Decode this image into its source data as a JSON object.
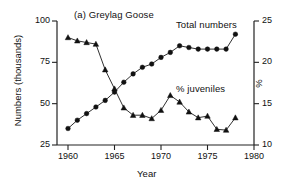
{
  "panel": {
    "title": "(a) Greylag Goose"
  },
  "axes": {
    "x_title": "Year",
    "y_left_title": "Numbers (thousands)",
    "y_right_title": "%",
    "x_ticks": [
      "1960",
      "1965",
      "1970",
      "1975",
      "1980"
    ],
    "y_left_ticks": [
      "100",
      "75",
      "50",
      "25"
    ],
    "y_right_ticks": [
      "25",
      "20",
      "15",
      "10"
    ]
  },
  "annotations": {
    "total_label": "Total numbers",
    "juveniles_label": "% juveniles"
  },
  "chart_data": {
    "type": "line",
    "title": "(a) Greylag Goose",
    "xlabel": "Year",
    "ylabel": "Numbers (thousands)",
    "ylabel_right": "%",
    "xlim": [
      1959,
      1980
    ],
    "ylim": [
      25,
      100
    ],
    "ylim_right": [
      10,
      25
    ],
    "xticks": [
      1960,
      1965,
      1970,
      1975,
      1980
    ],
    "yticks_left": [
      25,
      50,
      75,
      100
    ],
    "yticks_right": [
      10,
      15,
      20,
      25
    ],
    "grid": false,
    "legend": "inline-annotations",
    "series": [
      {
        "name": "Total numbers",
        "axis": "left",
        "units": "thousands",
        "marker": "filled-circle",
        "x": [
          1960,
          1961,
          1962,
          1963,
          1964,
          1965,
          1966,
          1967,
          1968,
          1969,
          1970,
          1971,
          1972,
          1973,
          1974,
          1975,
          1976,
          1977,
          1978
        ],
        "values": [
          35,
          40,
          44,
          48,
          52,
          57,
          63,
          68,
          72,
          74,
          78,
          81,
          85,
          84,
          83,
          83,
          83,
          83,
          92
        ]
      },
      {
        "name": "% juveniles",
        "axis": "right",
        "units": "percent",
        "marker": "filled-triangle",
        "x": [
          1960,
          1961,
          1962,
          1963,
          1964,
          1965,
          1966,
          1967,
          1968,
          1969,
          1970,
          1971,
          1972,
          1973,
          1974,
          1975,
          1976,
          1977,
          1978
        ],
        "values": [
          23.0,
          22.6,
          22.4,
          22.2,
          19.1,
          16.8,
          14.5,
          13.6,
          13.6,
          13.2,
          14.2,
          16.0,
          15.2,
          14.0,
          13.3,
          13.5,
          11.9,
          11.8,
          13.3
        ]
      }
    ]
  }
}
